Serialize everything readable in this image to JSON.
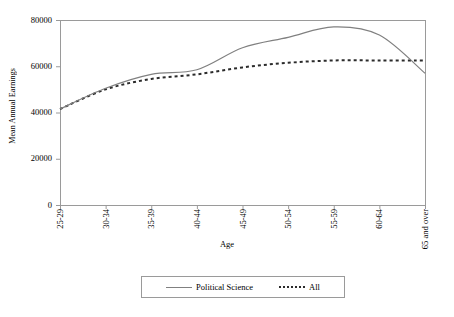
{
  "chart_data": {
    "type": "line",
    "title": "",
    "xlabel": "Age",
    "ylabel": "Mean Annual Earnings",
    "categories": [
      "25-29",
      "30-34",
      "35-39",
      "40-44",
      "45-49",
      "50-54",
      "55-59",
      "60-64",
      "65 and over"
    ],
    "ylim": [
      0,
      80000
    ],
    "yticks": [
      0,
      20000,
      40000,
      60000,
      80000
    ],
    "ytick_labels": [
      "0",
      "20000",
      "40000",
      "60000",
      "80000"
    ],
    "grid": false,
    "legend_position": "bottom",
    "series": [
      {
        "name": "Political Science",
        "style": "solid",
        "color": "#808080",
        "values": [
          41500,
          50500,
          56500,
          58500,
          68000,
          72500,
          77000,
          73500,
          57000
        ]
      },
      {
        "name": "All",
        "style": "dashed",
        "color": "#2b2b2b",
        "values": [
          41500,
          50000,
          54500,
          56500,
          59500,
          61500,
          62500,
          62500,
          62500
        ]
      }
    ]
  },
  "legend": {
    "entries": [
      {
        "label": "Political Science"
      },
      {
        "label": "All"
      }
    ]
  },
  "axes": {
    "y_label": "Mean Annual Earnings",
    "x_label": "Age"
  },
  "colors": {
    "political_science": "#808080",
    "all": "#2b2b2b",
    "axis": "#8d8d8d",
    "background": "#ffffff"
  }
}
